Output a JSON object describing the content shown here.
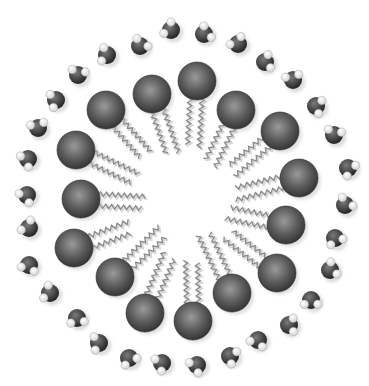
{
  "figure": {
    "width": 369,
    "height": 386,
    "center": [
      190,
      205
    ],
    "colors": {
      "background": "#ffffff",
      "head_light": "#9a9a9a",
      "head_mid": "#5a5a5a",
      "head_dark": "#2e2e2e",
      "tail": "#8a8a8a",
      "tail_shadow": "#d8d8d8",
      "oxygen_light": "#7a7a7a",
      "oxygen_dark": "#1e1e1e",
      "hydrogen": "#ffffff"
    },
    "head_radius": 19,
    "heads": [
      [
        106,
        110
      ],
      [
        152,
        94
      ],
      [
        197,
        81
      ],
      [
        236,
        110
      ],
      [
        280,
        131
      ],
      [
        299,
        178
      ],
      [
        286,
        225
      ],
      [
        277,
        273
      ],
      [
        232,
        293
      ],
      [
        193,
        321
      ],
      [
        145,
        313
      ],
      [
        115,
        277
      ],
      [
        74,
        248
      ],
      [
        81,
        199
      ],
      [
        76,
        150
      ]
    ],
    "tail_length": 50,
    "water_radius": 9,
    "water": [
      [
        171,
        30
      ],
      [
        140,
        46
      ],
      [
        107,
        55
      ],
      [
        78,
        75
      ],
      [
        56,
        100
      ],
      [
        38,
        128
      ],
      [
        28,
        159
      ],
      [
        204,
        34
      ],
      [
        238,
        44
      ],
      [
        265,
        62
      ],
      [
        293,
        80
      ],
      [
        316,
        106
      ],
      [
        334,
        135
      ],
      [
        348,
        168
      ],
      [
        345,
        205
      ],
      [
        335,
        238
      ],
      [
        330,
        270
      ],
      [
        311,
        300
      ],
      [
        289,
        325
      ],
      [
        258,
        340
      ],
      [
        230,
        356
      ],
      [
        197,
        365
      ],
      [
        27,
        195
      ],
      [
        29,
        228
      ],
      [
        29,
        265
      ],
      [
        50,
        293
      ],
      [
        77,
        318
      ],
      [
        99,
        343
      ],
      [
        129,
        358
      ],
      [
        162,
        363
      ]
    ]
  }
}
